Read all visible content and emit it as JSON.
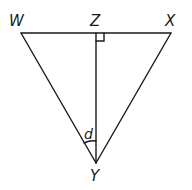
{
  "diagram": {
    "type": "triangle-with-altitude",
    "points": {
      "W": {
        "label": "W",
        "x": 21,
        "y": 33
      },
      "X": {
        "label": "X",
        "x": 171,
        "y": 33
      },
      "Y": {
        "label": "Y",
        "x": 96,
        "y": 163
      },
      "Z": {
        "label": "Z",
        "x": 96,
        "y": 33
      }
    },
    "segments": [
      "WX",
      "WY",
      "XY",
      "ZY"
    ],
    "right_angle": {
      "at": "Z",
      "between": [
        "ZX",
        "ZY"
      ]
    },
    "angle": {
      "vertex": "Y",
      "between": [
        "YW",
        "YZ"
      ],
      "label": "d"
    },
    "colors": {
      "line": "#1a1a1a",
      "background": "#ffffff"
    }
  }
}
